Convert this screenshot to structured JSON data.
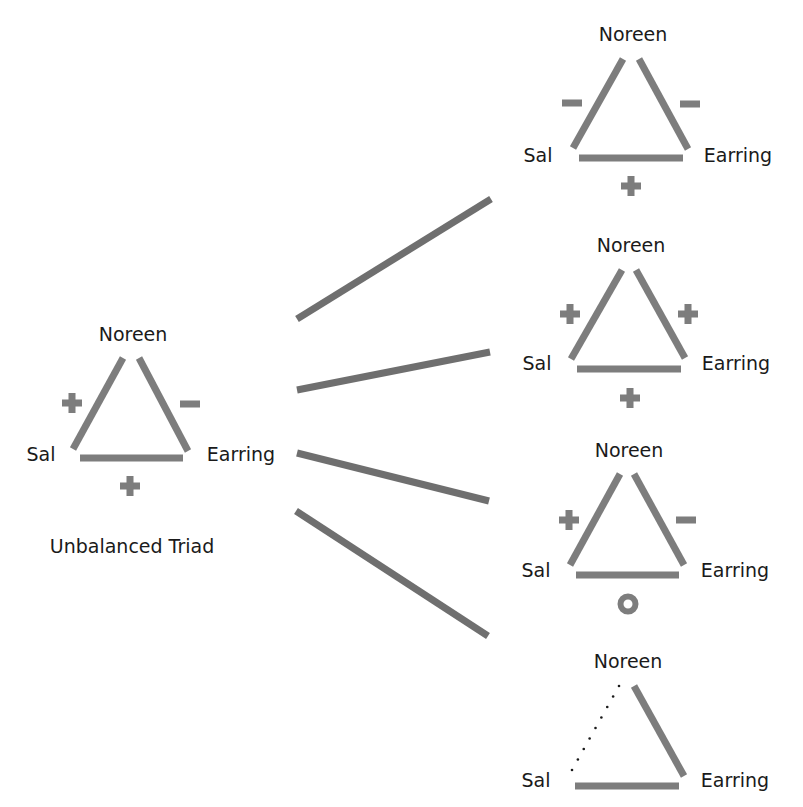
{
  "diagram": {
    "title": "Unbalanced Triad",
    "colors": {
      "edge": "#7d7d7d",
      "connector": "#6f6f6f",
      "text": "#1a1a1a",
      "background": "#ffffff"
    },
    "nodes_labels": {
      "top": "Noreen",
      "left": "Sal",
      "right": "Earring"
    },
    "source_triad": {
      "id": "unbalanced",
      "caption": "Unbalanced Triad",
      "labels": {
        "top": {
          "text": "Noreen",
          "x": 133,
          "y": 341
        },
        "left": {
          "text": "Sal",
          "x": 41,
          "y": 461
        },
        "right": {
          "text": "Earring",
          "x": 241,
          "y": 461
        }
      },
      "caption_pos": {
        "x": 132,
        "y": 553
      },
      "edges": [
        {
          "name": "sal-noreen",
          "x1": 73,
          "y1": 449,
          "x2": 123,
          "y2": 358,
          "style": "solid"
        },
        {
          "name": "noreen-earring",
          "x1": 139,
          "y1": 358,
          "x2": 188,
          "y2": 451,
          "style": "solid"
        },
        {
          "name": "sal-earring",
          "x1": 80,
          "y1": 458,
          "x2": 183,
          "y2": 458,
          "style": "solid"
        }
      ],
      "signs": [
        {
          "edge": "sal-noreen",
          "symbol": "+",
          "x": 72,
          "y": 403
        },
        {
          "edge": "noreen-earring",
          "symbol": "-",
          "x": 190,
          "y": 404
        },
        {
          "edge": "sal-earring",
          "symbol": "+",
          "x": 130,
          "y": 486
        }
      ]
    },
    "connectors": [
      {
        "to": "resolution-1",
        "x1": 297,
        "y1": 319,
        "x2": 491,
        "y2": 199
      },
      {
        "to": "resolution-2",
        "x1": 297,
        "y1": 390,
        "x2": 490,
        "y2": 352
      },
      {
        "to": "resolution-3",
        "x1": 297,
        "y1": 453,
        "x2": 489,
        "y2": 501
      },
      {
        "to": "resolution-4",
        "x1": 296,
        "y1": 511,
        "x2": 488,
        "y2": 636
      }
    ],
    "resolutions": [
      {
        "id": "resolution-1",
        "labels": {
          "top": {
            "text": "Noreen",
            "x": 633,
            "y": 41
          },
          "left": {
            "text": "Sal",
            "x": 538,
            "y": 162
          },
          "right": {
            "text": "Earring",
            "x": 738,
            "y": 162
          }
        },
        "edges": [
          {
            "name": "sal-noreen",
            "x1": 573,
            "y1": 148,
            "x2": 623,
            "y2": 59,
            "style": "solid"
          },
          {
            "name": "noreen-earring",
            "x1": 639,
            "y1": 59,
            "x2": 688,
            "y2": 149,
            "style": "solid"
          },
          {
            "name": "sal-earring",
            "x1": 579,
            "y1": 158,
            "x2": 683,
            "y2": 158,
            "style": "solid"
          }
        ],
        "signs": [
          {
            "edge": "sal-noreen",
            "symbol": "-",
            "x": 572,
            "y": 103
          },
          {
            "edge": "noreen-earring",
            "symbol": "-",
            "x": 690,
            "y": 104
          },
          {
            "edge": "sal-earring",
            "symbol": "+",
            "x": 631,
            "y": 186
          }
        ]
      },
      {
        "id": "resolution-2",
        "labels": {
          "top": {
            "text": "Noreen",
            "x": 631,
            "y": 252
          },
          "left": {
            "text": "Sal",
            "x": 537,
            "y": 370
          },
          "right": {
            "text": "Earring",
            "x": 736,
            "y": 370
          }
        },
        "edges": [
          {
            "name": "sal-noreen",
            "x1": 571,
            "y1": 359,
            "x2": 622,
            "y2": 270,
            "style": "solid"
          },
          {
            "name": "noreen-earring",
            "x1": 636,
            "y1": 270,
            "x2": 685,
            "y2": 358,
            "style": "solid"
          },
          {
            "name": "sal-earring",
            "x1": 577,
            "y1": 369,
            "x2": 681,
            "y2": 369,
            "style": "solid"
          }
        ],
        "signs": [
          {
            "edge": "sal-noreen",
            "symbol": "+",
            "x": 570,
            "y": 314
          },
          {
            "edge": "noreen-earring",
            "symbol": "+",
            "x": 688,
            "y": 314
          },
          {
            "edge": "sal-earring",
            "symbol": "+",
            "x": 630,
            "y": 398
          }
        ]
      },
      {
        "id": "resolution-3",
        "labels": {
          "top": {
            "text": "Noreen",
            "x": 629,
            "y": 457
          },
          "left": {
            "text": "Sal",
            "x": 536,
            "y": 577
          },
          "right": {
            "text": "Earring",
            "x": 735,
            "y": 577
          }
        },
        "edges": [
          {
            "name": "sal-noreen",
            "x1": 570,
            "y1": 565,
            "x2": 620,
            "y2": 474,
            "style": "solid"
          },
          {
            "name": "noreen-earring",
            "x1": 634,
            "y1": 474,
            "x2": 684,
            "y2": 565,
            "style": "solid"
          },
          {
            "name": "sal-earring",
            "x1": 576,
            "y1": 575,
            "x2": 679,
            "y2": 575,
            "style": "solid"
          }
        ],
        "signs": [
          {
            "edge": "sal-noreen",
            "symbol": "+",
            "x": 569,
            "y": 520
          },
          {
            "edge": "noreen-earring",
            "symbol": "-",
            "x": 686,
            "y": 520
          },
          {
            "edge": "sal-earring",
            "symbol": "o",
            "x": 628,
            "y": 604
          }
        ]
      },
      {
        "id": "resolution-4",
        "labels": {
          "top": {
            "text": "Noreen",
            "x": 628,
            "y": 668
          },
          "left": {
            "text": "Sal",
            "x": 536,
            "y": 787
          },
          "right": {
            "text": "Earring",
            "x": 735,
            "y": 787
          }
        },
        "edges": [
          {
            "name": "sal-noreen",
            "x1": 572,
            "y1": 770,
            "x2": 619,
            "y2": 686,
            "style": "dotted"
          },
          {
            "name": "noreen-earring",
            "x1": 634,
            "y1": 686,
            "x2": 684,
            "y2": 776,
            "style": "solid"
          },
          {
            "name": "sal-earring",
            "x1": 575,
            "y1": 786,
            "x2": 679,
            "y2": 786,
            "style": "solid"
          }
        ],
        "signs": []
      }
    ]
  }
}
